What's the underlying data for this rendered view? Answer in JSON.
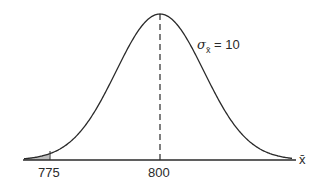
{
  "diagram": {
    "mean_label": "800",
    "tail_label": "775",
    "sigma_label_symbol": "σ",
    "sigma_label_sub": "x̄",
    "sigma_label_value": "= 10",
    "axis_label": "x̄",
    "shaded_color": "#bdbdbd",
    "line_color": "#2a2a2a"
  },
  "chart_data": {
    "type": "line",
    "title": "",
    "xlabel": "x̄",
    "ylabel": "",
    "distribution": "normal",
    "mean": 800,
    "sd": 10,
    "x_ticks": [
      775,
      800
    ],
    "shaded_region": {
      "from": null,
      "to": 775,
      "description": "left tail below 775"
    },
    "annotations": [
      "σx̄ = 10",
      "dashed vertical line at mean 800"
    ]
  }
}
